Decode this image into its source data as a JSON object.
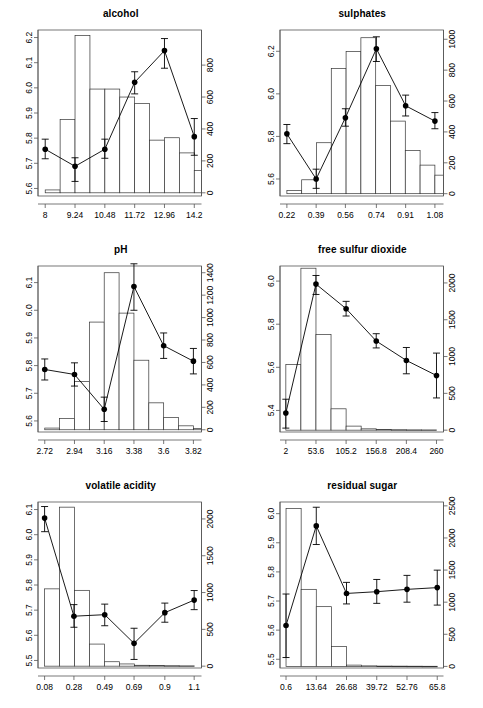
{
  "figure": {
    "layout": "2 columns x 3 rows",
    "width": 483,
    "height": 708,
    "background": "#ffffff",
    "line_color": "#000000",
    "bar_fill": "#ffffff",
    "bar_stroke": "#000000"
  },
  "chart_data": [
    {
      "type": "bar",
      "title": "alcohol",
      "xlabel": "",
      "ylabel": "",
      "legend": "none",
      "grid": false,
      "xticks": [
        "8",
        "9.24",
        "10.48",
        "11.72",
        "12.96",
        "14.2"
      ],
      "xtick_values": [
        8,
        9.24,
        10.48,
        11.72,
        12.96,
        14.2
      ],
      "xlim": [
        7.7,
        14.5
      ],
      "left_axis": {
        "ticks": [
          "5.6",
          "5.7",
          "5.8",
          "5.9",
          "6.0",
          "6.1",
          "6.2"
        ],
        "tick_values": [
          5.6,
          5.7,
          5.8,
          5.9,
          6.0,
          6.1,
          6.2
        ],
        "ylim": [
          5.57,
          6.23
        ]
      },
      "right_axis": {
        "ticks": [
          "0",
          "200",
          "400",
          "600",
          "800"
        ],
        "tick_values": [
          0,
          200,
          400,
          600,
          800
        ],
        "ylim": [
          -20,
          1020
        ]
      },
      "histogram": {
        "bin_edges": [
          8.0,
          8.62,
          9.24,
          9.86,
          10.48,
          11.1,
          11.72,
          12.34,
          12.96,
          13.58,
          14.2
        ],
        "counts": [
          18,
          460,
          985,
          650,
          650,
          600,
          560,
          330,
          345,
          250,
          140,
          35,
          12
        ]
      },
      "points": {
        "x": [
          8.0,
          9.24,
          10.48,
          11.72,
          12.96,
          14.2
        ],
        "y": [
          5.756,
          5.688,
          5.756,
          6.022,
          6.148,
          5.806
        ],
        "err_low": [
          5.718,
          5.628,
          5.72,
          5.976,
          6.078,
          5.732
        ],
        "err_high": [
          5.796,
          5.722,
          5.796,
          6.064,
          6.196,
          5.878
        ]
      }
    },
    {
      "type": "bar",
      "title": "sulphates",
      "xlabel": "",
      "ylabel": "",
      "legend": "none",
      "grid": false,
      "xticks": [
        "0.22",
        "0.39",
        "0.56",
        "0.74",
        "0.91",
        "1.08"
      ],
      "xtick_values": [
        0.22,
        0.39,
        0.56,
        0.74,
        0.91,
        1.08
      ],
      "xlim": [
        0.18,
        1.13
      ],
      "left_axis": {
        "ticks": [
          "5.6",
          "5.8",
          "6.0",
          "6.2"
        ],
        "tick_values": [
          5.6,
          5.8,
          6.0,
          6.2
        ],
        "ylim": [
          5.52,
          6.3
        ]
      },
      "right_axis": {
        "ticks": [
          "0",
          "200",
          "400",
          "600",
          "800",
          "1000"
        ],
        "tick_values": [
          0,
          200,
          400,
          600,
          800,
          1000
        ],
        "ylim": [
          -15,
          1060
        ]
      },
      "histogram": {
        "bin_edges": [
          0.22,
          0.305,
          0.39,
          0.475,
          0.56,
          0.645,
          0.735,
          0.82,
          0.905,
          0.99,
          1.08
        ],
        "counts": [
          20,
          90,
          330,
          810,
          920,
          1010,
          700,
          470,
          280,
          185,
          120,
          70,
          35,
          25,
          18,
          15
        ]
      },
      "points": {
        "x": [
          0.22,
          0.39,
          0.56,
          0.74,
          0.91,
          1.08
        ],
        "y": [
          5.812,
          5.6,
          5.888,
          6.212,
          5.944,
          5.872
        ],
        "err_low": [
          5.766,
          5.556,
          5.848,
          6.152,
          5.896,
          5.836
        ],
        "err_high": [
          5.856,
          5.646,
          5.93,
          6.268,
          5.994,
          5.912
        ]
      }
    },
    {
      "type": "bar",
      "title": "pH",
      "xlabel": "",
      "ylabel": "",
      "legend": "none",
      "grid": false,
      "xticks": [
        "2.72",
        "2.94",
        "3.16",
        "3.38",
        "3.6",
        "3.82"
      ],
      "xtick_values": [
        2.72,
        2.94,
        3.16,
        3.38,
        3.6,
        3.82
      ],
      "xlim": [
        2.67,
        3.88
      ],
      "left_axis": {
        "ticks": [
          "5.6",
          "5.7",
          "5.8",
          "5.9",
          "6.0",
          "6.1"
        ],
        "tick_values": [
          5.6,
          5.7,
          5.8,
          5.9,
          6.0,
          6.1
        ],
        "ylim": [
          5.56,
          6.16
        ]
      },
      "right_axis": {
        "ticks": [
          "0",
          "200",
          "400",
          "600",
          "800",
          "1000",
          "1200",
          "1400"
        ],
        "tick_values": [
          0,
          200,
          400,
          600,
          800,
          1000,
          1200,
          1400
        ],
        "ylim": [
          -20,
          1460
        ]
      },
      "histogram": {
        "bin_edges": [
          2.72,
          2.83,
          2.94,
          3.05,
          3.16,
          3.27,
          3.38,
          3.49,
          3.6,
          3.71,
          3.82
        ],
        "counts": [
          15,
          100,
          430,
          960,
          1400,
          1040,
          620,
          240,
          110,
          35,
          12
        ]
      },
      "points": {
        "x": [
          2.72,
          2.94,
          3.16,
          3.38,
          3.6,
          3.82
        ],
        "y": [
          5.786,
          5.768,
          5.642,
          6.086,
          5.872,
          5.816
        ],
        "err_low": [
          5.748,
          5.726,
          5.598,
          6.0,
          5.826,
          5.77
        ],
        "err_high": [
          5.824,
          5.81,
          5.686,
          6.168,
          5.918,
          5.862
        ]
      }
    },
    {
      "type": "bar",
      "title": "free sulfur dioxide",
      "xlabel": "",
      "ylabel": "",
      "legend": "none",
      "grid": false,
      "xticks": [
        "2",
        "53.6",
        "105.2",
        "156.8",
        "208.4",
        "260"
      ],
      "xtick_values": [
        2,
        53.6,
        105.2,
        156.8,
        208.4,
        260
      ],
      "xlim": [
        -8,
        272
      ],
      "left_axis": {
        "ticks": [
          "5.4",
          "5.6",
          "5.8",
          "6.0"
        ],
        "tick_values": [
          5.4,
          5.6,
          5.8,
          6.0
        ],
        "ylim": [
          5.3,
          6.07
        ]
      },
      "right_axis": {
        "ticks": [
          "0",
          "500",
          "1000",
          "1500",
          "2000"
        ],
        "tick_values": [
          0,
          500,
          1000,
          1500,
          2000
        ],
        "ylim": [
          -25,
          2230
        ]
      },
      "histogram": {
        "bin_edges": [
          2,
          27.8,
          53.6,
          79.4,
          105.2,
          131,
          156.8,
          182.6,
          208.4,
          234.2,
          260
        ],
        "counts": [
          890,
          2200,
          1300,
          290,
          55,
          18,
          10,
          6,
          4,
          3
        ]
      },
      "points": {
        "x": [
          2,
          53.6,
          105.2,
          156.8,
          208.4,
          260
        ],
        "y": [
          5.388,
          5.986,
          5.872,
          5.722,
          5.632,
          5.562
        ],
        "err_low": [
          5.318,
          5.938,
          5.838,
          5.69,
          5.57,
          5.458
        ],
        "err_high": [
          5.452,
          6.026,
          5.906,
          5.756,
          5.692,
          5.666
        ]
      }
    },
    {
      "type": "bar",
      "title": "volatile acidity",
      "xlabel": "",
      "ylabel": "",
      "legend": "none",
      "grid": false,
      "xticks": [
        "0.08",
        "0.28",
        "0.49",
        "0.69",
        "0.9",
        "1.1"
      ],
      "xtick_values": [
        0.08,
        0.28,
        0.49,
        0.69,
        0.9,
        1.1
      ],
      "xlim": [
        0.035,
        1.15
      ],
      "left_axis": {
        "ticks": [
          "5.5",
          "5.6",
          "5.7",
          "5.8",
          "5.9",
          "6.0",
          "6.1"
        ],
        "tick_values": [
          5.5,
          5.6,
          5.7,
          5.8,
          5.9,
          6.0,
          6.1
        ],
        "ylim": [
          5.47,
          6.13
        ]
      },
      "right_axis": {
        "ticks": [
          "0",
          "500",
          "1000",
          "1500",
          "2000"
        ],
        "tick_values": [
          0,
          500,
          1000,
          1500,
          2000
        ],
        "ylim": [
          -25,
          2230
        ]
      },
      "histogram": {
        "bin_edges": [
          0.08,
          0.182,
          0.284,
          0.386,
          0.488,
          0.59,
          0.692,
          0.794,
          0.896,
          0.998,
          1.1
        ],
        "counts": [
          1050,
          2160,
          1030,
          300,
          60,
          30,
          12,
          8,
          6,
          4
        ]
      },
      "points": {
        "x": [
          0.08,
          0.28,
          0.49,
          0.69,
          0.9,
          1.1
        ],
        "y": [
          6.066,
          5.676,
          5.682,
          5.568,
          5.69,
          5.74
        ],
        "err_low": [
          6.012,
          5.632,
          5.638,
          5.504,
          5.652,
          5.702
        ],
        "err_high": [
          6.112,
          5.722,
          5.724,
          5.628,
          5.728,
          5.778
        ]
      }
    },
    {
      "type": "bar",
      "title": "residual sugar",
      "xlabel": "",
      "ylabel": "",
      "legend": "none",
      "grid": false,
      "xticks": [
        "0.6",
        "13.64",
        "26.68",
        "39.72",
        "52.76",
        "65.8"
      ],
      "xtick_values": [
        0.6,
        13.64,
        26.68,
        39.72,
        52.76,
        65.8
      ],
      "xlim": [
        -2,
        68.5
      ],
      "left_axis": {
        "ticks": [
          "5.5",
          "5.6",
          "5.7",
          "5.8",
          "5.9",
          "6.0"
        ],
        "tick_values": [
          5.5,
          5.6,
          5.7,
          5.8,
          5.9,
          6.0
        ],
        "ylim": [
          5.47,
          6.04
        ]
      },
      "right_axis": {
        "ticks": [
          "0",
          "500",
          "1000",
          "1500",
          "2000",
          "2500"
        ],
        "tick_values": [
          0,
          500,
          1000,
          1500,
          2000,
          2500
        ],
        "ylim": [
          -25,
          2560
        ]
      },
      "histogram": {
        "bin_edges": [
          0.6,
          7.12,
          13.64,
          20.16,
          26.68,
          33.2,
          39.72,
          46.24,
          52.76,
          59.28,
          65.8
        ],
        "counts": [
          2460,
          1200,
          930,
          310,
          20,
          8,
          5,
          4,
          3,
          2
        ]
      },
      "points": {
        "x": [
          0.6,
          13.64,
          26.68,
          39.72,
          52.76,
          65.8
        ],
        "y": [
          5.616,
          5.958,
          5.726,
          5.732,
          5.74,
          5.746
        ],
        "err_low": [
          5.506,
          5.894,
          5.69,
          5.692,
          5.696,
          5.686
        ],
        "err_high": [
          5.724,
          6.022,
          5.764,
          5.774,
          5.788,
          5.806
        ]
      }
    }
  ]
}
